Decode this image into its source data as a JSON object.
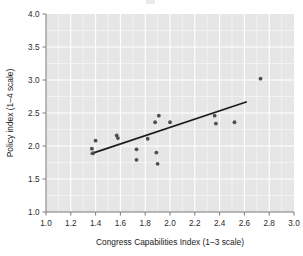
{
  "figure": {
    "background_color": "#ffffff",
    "panel_color": "#e6e6e6",
    "grid_color": "#ffffff",
    "point_color": "#4d4d55",
    "line_color": "#1c1c1c"
  },
  "axes": {
    "x_title": "Congress Capabilities Index (1–3 scale)",
    "y_title": "Policy index (1–4 scale)",
    "x_ticks": [
      "1.0",
      "1.2",
      "1.4",
      "1.6",
      "1.8",
      "2.0",
      "2.2",
      "2.4",
      "2.6",
      "2.8",
      "3.0"
    ],
    "y_ticks": [
      "1.0",
      "1.5",
      "2.0",
      "2.5",
      "3.0",
      "3.5",
      "4.0"
    ]
  },
  "chart_data": {
    "type": "scatter",
    "title": "",
    "xlabel": "Congress Capabilities Index (1–3 scale)",
    "ylabel": "Policy index (1–4 scale)",
    "xlim": [
      1.0,
      3.0
    ],
    "ylim": [
      1.0,
      4.0
    ],
    "xticks": [
      1.0,
      1.2,
      1.4,
      1.6,
      1.8,
      2.0,
      2.2,
      2.4,
      2.6,
      2.8,
      3.0
    ],
    "yticks": [
      1.0,
      1.5,
      2.0,
      2.5,
      3.0,
      3.5,
      4.0
    ],
    "grid": true,
    "legend": "none",
    "points": [
      {
        "x": 1.37,
        "y": 1.96
      },
      {
        "x": 1.38,
        "y": 1.89
      },
      {
        "x": 1.4,
        "y": 2.08
      },
      {
        "x": 1.57,
        "y": 2.16
      },
      {
        "x": 1.58,
        "y": 2.12
      },
      {
        "x": 1.73,
        "y": 1.95
      },
      {
        "x": 1.73,
        "y": 1.79
      },
      {
        "x": 1.82,
        "y": 2.11
      },
      {
        "x": 1.88,
        "y": 2.36
      },
      {
        "x": 1.89,
        "y": 1.9
      },
      {
        "x": 1.9,
        "y": 1.73
      },
      {
        "x": 1.91,
        "y": 2.46
      },
      {
        "x": 2.0,
        "y": 2.36
      },
      {
        "x": 2.36,
        "y": 2.46
      },
      {
        "x": 2.37,
        "y": 2.34
      },
      {
        "x": 2.52,
        "y": 2.36
      },
      {
        "x": 2.73,
        "y": 3.02
      }
    ],
    "fit_line": {
      "type": "linear",
      "x_start": 1.36,
      "y_start": 1.88,
      "x_end": 2.62,
      "y_end": 2.67,
      "slope": 0.627,
      "intercept": 1.027
    }
  }
}
